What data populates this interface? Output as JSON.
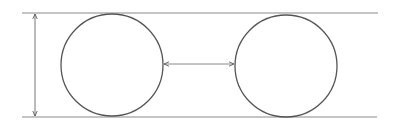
{
  "diagram": {
    "colors": {
      "background": "#ffffff",
      "stroke": "#555555",
      "line": "#8a8a8a"
    },
    "top_line": {
      "x1": 22,
      "x2": 378,
      "y": 13
    },
    "bottom_line": {
      "x1": 22,
      "x2": 377,
      "y": 117
    },
    "vertical_arrow": {
      "x": 35,
      "y1": 13,
      "y2": 117
    },
    "circles": [
      {
        "cx": 112,
        "cy": 65,
        "r": 51
      },
      {
        "cx": 286,
        "cy": 66,
        "r": 51
      }
    ],
    "horizontal_arrow": {
      "x1": 163,
      "x2": 235,
      "y": 64
    }
  }
}
